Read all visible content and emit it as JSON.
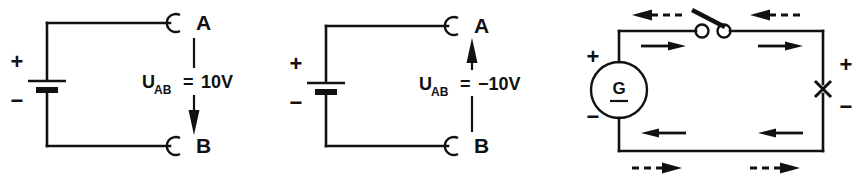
{
  "figure": {
    "ink_color": "#111111",
    "background_color": "#ffffff",
    "width": 864,
    "height": 178
  },
  "circuits": [
    {
      "id": "circuit-left",
      "source_type": "battery",
      "terminal_top_label": "A",
      "terminal_bottom_label": "B",
      "plus_label": "+",
      "minus_label": "−",
      "voltage_symbol": "U",
      "voltage_subscript": "AB",
      "voltage_equals": "=",
      "voltage_value": "10V",
      "voltage_full": "U_AB = 10V",
      "arrow_direction": "down"
    },
    {
      "id": "circuit-middle",
      "source_type": "battery",
      "terminal_top_label": "A",
      "terminal_bottom_label": "B",
      "plus_label": "+",
      "minus_label": "−",
      "voltage_symbol": "U",
      "voltage_subscript": "AB",
      "voltage_equals": "=",
      "voltage_value": "−10V",
      "voltage_full": "U_AB = −10V",
      "arrow_direction": "up"
    },
    {
      "id": "circuit-right",
      "source_type": "generator",
      "generator_label": "G",
      "source_plus_label": "+",
      "source_minus_label": "−",
      "load_plus_label": "+",
      "load_minus_label": "−",
      "load_symbol": "x-marker",
      "switch_state": "open",
      "inner_arrow_top_direction": "right",
      "inner_arrow_bottom_direction": "left",
      "outer_dashed_arrow_top_direction": "left",
      "outer_dashed_arrow_bottom_direction": "right"
    }
  ]
}
